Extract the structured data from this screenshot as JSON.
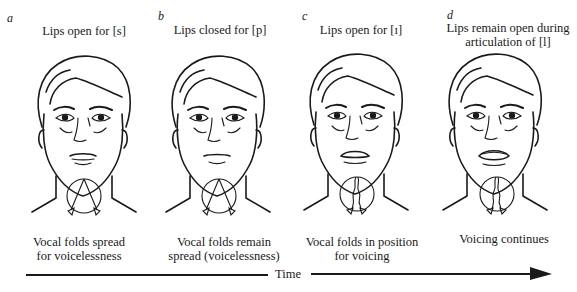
{
  "figure": {
    "panels": [
      {
        "letter": "a",
        "top_caption": [
          "Lips open for [s]"
        ],
        "bottom_caption": [
          "Vocal folds spread",
          "for voicelessness"
        ],
        "mouth": "open-slightly",
        "vocal_folds": "spread"
      },
      {
        "letter": "b",
        "top_caption": [
          "Lips closed for [p]"
        ],
        "bottom_caption": [
          "Vocal folds remain",
          "spread (voicelessness)"
        ],
        "mouth": "closed",
        "vocal_folds": "spread"
      },
      {
        "letter": "c",
        "top_caption": [
          "Lips open for [ɪ]"
        ],
        "bottom_caption": [
          "Vocal folds in position",
          "for voicing"
        ],
        "mouth": "open",
        "vocal_folds": "vibrating"
      },
      {
        "letter": "d",
        "top_caption": [
          "Lips remain open during",
          "articulation of [l]"
        ],
        "bottom_caption": [
          "Voicing continues"
        ],
        "mouth": "open-wide",
        "vocal_folds": "vibrating"
      }
    ],
    "timeline": {
      "label": "Time",
      "direction": "left-to-right"
    }
  }
}
